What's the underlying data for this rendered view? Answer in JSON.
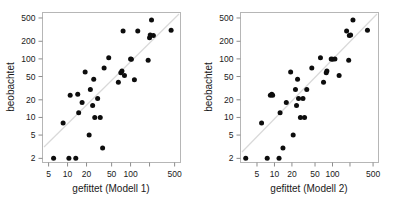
{
  "figure": {
    "background_color": "#ffffff",
    "point_color": "#0d0d0d",
    "frame_color": "#b6b6b6",
    "reference_line_color": "#d9d9d9"
  },
  "chart_data": [
    {
      "type": "scatter",
      "title": "",
      "xlabel": "gefittet (Modell 1)",
      "ylabel": "beobachtet",
      "xscale": "log",
      "yscale": "log",
      "xlim": [
        4.0,
        620
      ],
      "ylim": [
        1.7,
        620
      ],
      "grid": false,
      "legend": null,
      "xticks": [
        5,
        10,
        20,
        50,
        100,
        200,
        500
      ],
      "xticklabels": [
        "5",
        "10",
        "20",
        "50",
        "100",
        "",
        "500"
      ],
      "yticks": [
        2,
        5,
        10,
        20,
        50,
        100,
        200,
        500
      ],
      "yticklabels": [
        "2",
        "5",
        "10",
        "20",
        "50",
        "100",
        "200",
        "500"
      ],
      "annotations": [
        "diagonal reference line y = x"
      ],
      "x": [
        6.0,
        8.5,
        10.5,
        11.0,
        13.5,
        14.5,
        15.0,
        17.0,
        19.0,
        22.0,
        23.0,
        25.0,
        26.0,
        27.0,
        30.0,
        33.0,
        36.0,
        38.0,
        45.0,
        64.0,
        70.0,
        73.0,
        76.0,
        80.0,
        100.0,
        103.0,
        115.0,
        130.0,
        190.0,
        200.0,
        205.0,
        215.0,
        230.0,
        440.0
      ],
      "y": [
        2.0,
        8.0,
        2.0,
        24.0,
        2.0,
        25.0,
        12.0,
        18.0,
        60.0,
        5.0,
        30.0,
        16.0,
        45.0,
        10.0,
        21.0,
        10.0,
        3.0,
        70.0,
        105.0,
        40.0,
        58.0,
        62.0,
        300.0,
        52.0,
        100.0,
        99.0,
        44.0,
        300.0,
        95.0,
        230.0,
        255.0,
        460.0,
        250.0,
        310.0
      ]
    },
    {
      "type": "scatter",
      "title": "",
      "xlabel": "gefittet (Modell 2)",
      "ylabel": "beobachtet",
      "xscale": "log",
      "yscale": "log",
      "xlim": [
        2.6,
        620
      ],
      "ylim": [
        1.7,
        620
      ],
      "grid": false,
      "legend": null,
      "xticks": [
        5,
        10,
        20,
        50,
        100,
        200,
        500
      ],
      "xticklabels": [
        "5",
        "10",
        "20",
        "50",
        "100",
        "",
        "500"
      ],
      "yticks": [
        2,
        5,
        10,
        20,
        50,
        100,
        200,
        500
      ],
      "yticklabels": [
        "2",
        "5",
        "10",
        "20",
        "50",
        "100",
        "200",
        "500"
      ],
      "annotations": [
        "diagonal reference line y = x"
      ],
      "x": [
        3.2,
        6.0,
        7.5,
        8.5,
        9.0,
        9.3,
        12.0,
        12.5,
        14.0,
        16.0,
        19.0,
        21.0,
        23.0,
        24.0,
        25.0,
        26.0,
        28.0,
        31.0,
        33.0,
        36.0,
        44.0,
        62.0,
        70.0,
        78.0,
        80.0,
        95.0,
        100.0,
        110.0,
        130.0,
        175.0,
        190.0,
        195.0,
        205.0,
        225.0,
        400.0
      ],
      "y": [
        2.0,
        8.0,
        2.0,
        24.0,
        25.0,
        24.0,
        2.0,
        12.0,
        3.0,
        18.0,
        60.0,
        5.0,
        30.0,
        16.0,
        45.0,
        21.0,
        10.0,
        21.0,
        10.0,
        30.0,
        70.0,
        105.0,
        40.0,
        58.0,
        62.0,
        100.0,
        99.0,
        100.0,
        52.0,
        300.0,
        95.0,
        250.0,
        255.0,
        460.0,
        310.0
      ]
    }
  ]
}
